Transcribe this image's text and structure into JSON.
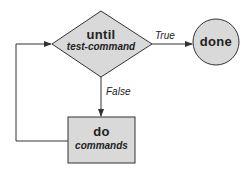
{
  "diagram": {
    "decision": {
      "keyword": "until",
      "condition": "test-command"
    },
    "terminal": {
      "label": "done"
    },
    "process": {
      "keyword": "do",
      "body": "commands"
    },
    "edges": {
      "true_label": "True",
      "false_label": "False"
    },
    "colors": {
      "fill": "#d9d9d9",
      "stroke": "#333333",
      "text": "#222222"
    }
  }
}
